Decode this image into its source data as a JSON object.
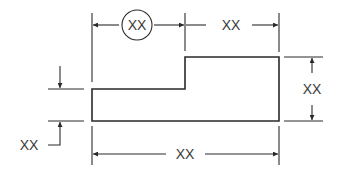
{
  "diagram": {
    "type": "dimensioned-drawing",
    "colors": {
      "line": "#2a2a2a",
      "text": "#3a3a3a",
      "background": "#ffffff"
    },
    "dimensions": {
      "top_left_circled": {
        "label": "XX",
        "circled": true,
        "note": "reference dimension"
      },
      "top_right": {
        "label": "XX"
      },
      "right_height": {
        "label": "XX"
      },
      "left_step_height": {
        "label": "XX"
      },
      "bottom_overall_width": {
        "label": "XX"
      }
    }
  }
}
